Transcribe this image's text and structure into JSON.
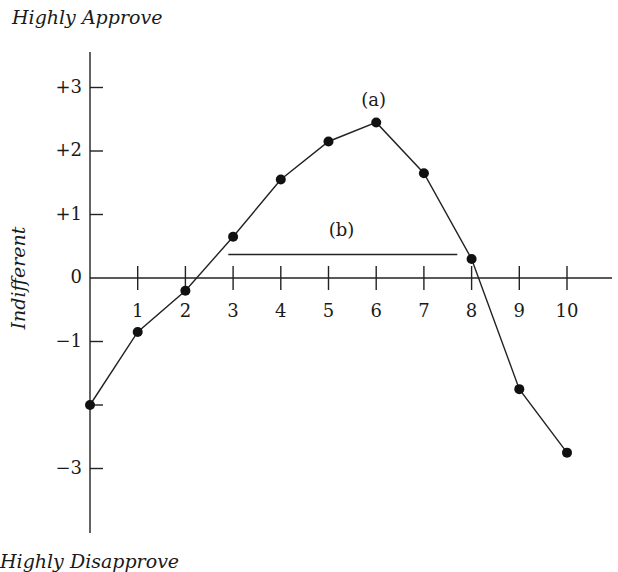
{
  "chart_data": {
    "type": "line",
    "title": "",
    "top_label": "Highly Approve",
    "bottom_label": "Highly Disapprove",
    "ylabel": "Indifferent",
    "xlabel": "",
    "x": [
      0,
      1,
      2,
      3,
      4,
      5,
      6,
      7,
      8,
      9,
      10
    ],
    "series": [
      {
        "name": "attitude",
        "values": [
          -2.0,
          -0.85,
          -0.2,
          0.65,
          1.55,
          2.15,
          2.45,
          1.65,
          0.3,
          -1.75,
          -2.75
        ]
      }
    ],
    "x_tick_labels": [
      "1",
      "2",
      "3",
      "4",
      "5",
      "6",
      "7",
      "8",
      "9",
      "10"
    ],
    "y_ticks": [
      3,
      2,
      1,
      0,
      -1,
      -2,
      -3
    ],
    "y_tick_labels": [
      "+3",
      "+2",
      "+1",
      "0",
      "−1",
      "",
      "−3"
    ],
    "xlim": [
      0,
      11
    ],
    "ylim": [
      -4,
      3.5
    ],
    "grid": false,
    "legend": "none",
    "annotations": [
      {
        "label": "(a)",
        "x": 6,
        "y": 2.45,
        "note": "peak point"
      },
      {
        "label": "(b)",
        "type": "horizontal-segment",
        "x_start": 2.9,
        "x_end": 7.7,
        "y": 0.37
      }
    ]
  }
}
